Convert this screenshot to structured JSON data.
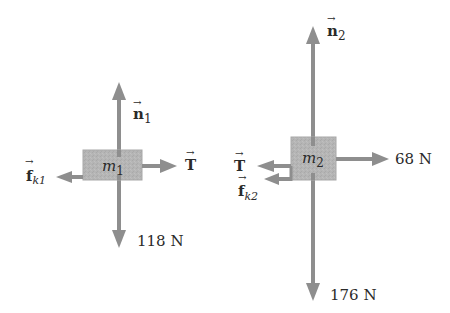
{
  "colors": {
    "arrow": "#8e8e8e",
    "block_fill": "#b5b5b5",
    "block_stroke": "#a8a8a8",
    "text": "#2a2a2a",
    "background": "#ffffff"
  },
  "diagram": {
    "type": "free-body-diagrams",
    "bodies": [
      {
        "id": "m1",
        "label_base": "m",
        "label_sub": "1",
        "forces": [
          {
            "name": "normal",
            "symbol": "n",
            "sub": "1",
            "direction": "up",
            "vector": true
          },
          {
            "name": "weight",
            "text": "118 N",
            "direction": "down",
            "vector": false
          },
          {
            "name": "tension",
            "symbol": "T",
            "sub": "",
            "direction": "right",
            "vector": true
          },
          {
            "name": "kinetic-friction",
            "symbol": "f",
            "sub": "k1",
            "direction": "left",
            "vector": true
          }
        ]
      },
      {
        "id": "m2",
        "label_base": "m",
        "label_sub": "2",
        "forces": [
          {
            "name": "normal",
            "symbol": "n",
            "sub": "2",
            "direction": "up",
            "vector": true
          },
          {
            "name": "weight",
            "text": "176 N",
            "direction": "down",
            "vector": false
          },
          {
            "name": "applied",
            "text": "68 N",
            "direction": "right",
            "vector": false
          },
          {
            "name": "tension",
            "symbol": "T",
            "sub": "",
            "direction": "left",
            "vector": true
          },
          {
            "name": "kinetic-friction",
            "symbol": "f",
            "sub": "k2",
            "direction": "left",
            "vector": true
          }
        ]
      }
    ]
  },
  "labels": {
    "m1_base": "m",
    "m1_sub": "1",
    "m2_base": "m",
    "m2_sub": "2",
    "n1_sym": "n",
    "n1_sub": "1",
    "n2_sym": "n",
    "n2_sub": "2",
    "T1_sym": "T",
    "T2_sym": "T",
    "fk1_sym": "f",
    "fk1_sub": "k1",
    "fk2_sym": "f",
    "fk2_sub": "k2",
    "w1": "118 N",
    "w2": "176 N",
    "F_applied": "68 N",
    "vec_arrow": "→"
  }
}
